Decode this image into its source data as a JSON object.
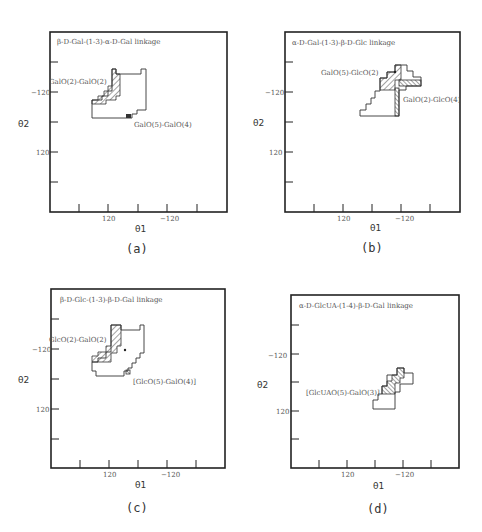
{
  "figure": {
    "panels": [
      {
        "id": "a",
        "caption": "(a)",
        "title": "β-D-Gal-(1-3)-α-D-Gal linkage",
        "x_axis_label": "θ1",
        "y_axis_label": "θ2",
        "x_tick_labels": [
          "120",
          "−120"
        ],
        "y_tick_labels": [
          "−120",
          "120"
        ],
        "annotations": [
          "GalO(2)-GalO(2)",
          "GalO(5)-GalO(4)"
        ]
      },
      {
        "id": "b",
        "caption": "(b)",
        "title": "α-D-Gal-(1-3)-β-D-Glc linkage",
        "x_axis_label": "θ1",
        "y_axis_label": "θ2",
        "x_tick_labels": [
          "120",
          "−120"
        ],
        "y_tick_labels": [
          "−120",
          "120"
        ],
        "annotations": [
          "GalO(5)-GlcO(2)",
          "GalO(2)-GlcO(4)"
        ]
      },
      {
        "id": "c",
        "caption": "(c)",
        "title": "β-D-Glc-(1-3)-β-D-Gal linkage",
        "x_axis_label": "θ1",
        "y_axis_label": "θ2",
        "x_tick_labels": [
          "120",
          "−120"
        ],
        "y_tick_labels": [
          "−120",
          "120"
        ],
        "annotations": [
          "GlcO(2)-GalO(2)",
          "[GlcO(5)-GalO(4)]"
        ]
      },
      {
        "id": "d",
        "caption": "(d)",
        "title": "α-D-GlcUA-(1-4)-β-D-Gal linkage",
        "x_axis_label": "θ1",
        "y_axis_label": "θ2",
        "x_tick_labels": [
          "120",
          "−120"
        ],
        "y_tick_labels": [
          "−120",
          "120"
        ],
        "annotations": [
          "[GlcUAO(5)-GalO(3)]"
        ]
      }
    ]
  }
}
